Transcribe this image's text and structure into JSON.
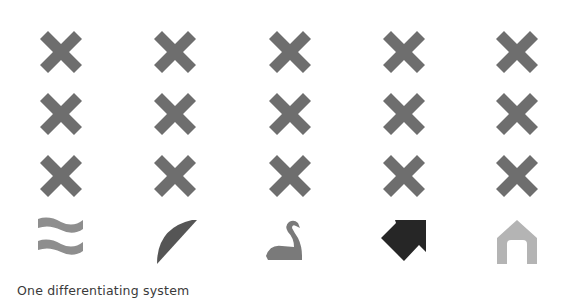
{
  "caption": "One differentiating system",
  "colors": {
    "cross": "#6e6e6e",
    "waves": "#8e8e8e",
    "leaf": "#555555",
    "swan": "#7a7a7a",
    "arrow": "#262626",
    "house": "#b4b4b4"
  },
  "grid": {
    "columns": 5,
    "cross_rows": 3,
    "column_centers_x": [
      61,
      175,
      290,
      404,
      517
    ],
    "row_centers_y": [
      52,
      114,
      176
    ],
    "symbol_row_center_y": 241
  },
  "symbols": [
    {
      "name": "waves-icon",
      "column": 1
    },
    {
      "name": "leaf-arc-icon",
      "column": 2
    },
    {
      "name": "swan-icon",
      "column": 3
    },
    {
      "name": "arrow-up-left-icon",
      "column": 4
    },
    {
      "name": "house-outline-icon",
      "column": 5
    }
  ]
}
